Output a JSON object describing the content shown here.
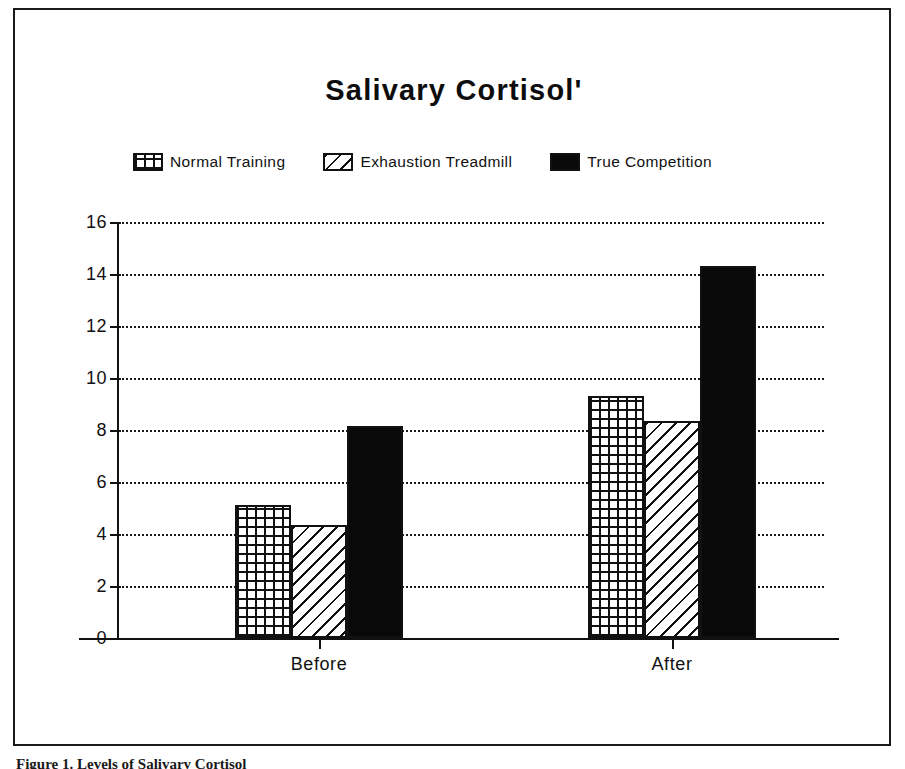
{
  "figure": {
    "caption_partial": "Figure 1.  Levels of Salivary Cortisol"
  },
  "chart_data": {
    "type": "bar",
    "title": "Salivary Cortisol'",
    "xlabel": "",
    "ylabel": "",
    "categories": [
      "Before",
      "After"
    ],
    "series": [
      {
        "name": "Normal Training",
        "pattern": "crosshatch",
        "color": "#ffffff",
        "values": [
          5.1,
          9.3
        ]
      },
      {
        "name": "Exhaustion Treadmill",
        "pattern": "diagonal-stripe",
        "color": "#ffffff",
        "values": [
          4.35,
          8.35
        ]
      },
      {
        "name": "True Competition",
        "pattern": "solid",
        "color": "#090909",
        "values": [
          8.15,
          14.3
        ]
      }
    ],
    "ylim": [
      0,
      16
    ],
    "ytick_step": 2,
    "yticks": [
      16,
      14,
      12,
      10,
      8,
      6,
      4,
      2,
      0
    ],
    "grid": true,
    "grid_style": "dotted",
    "legend_position": "top"
  }
}
